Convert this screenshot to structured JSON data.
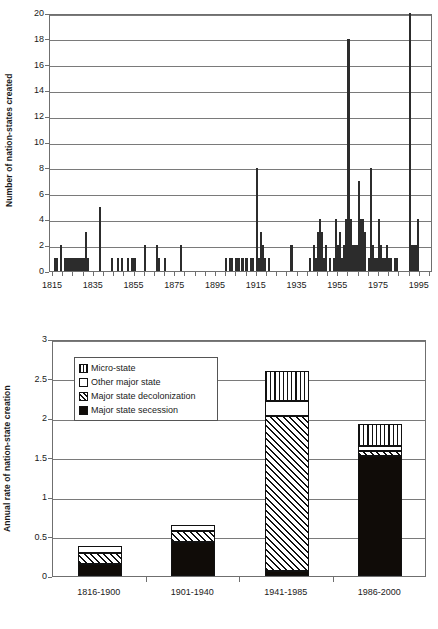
{
  "figure": {
    "charts": [
      {
        "id": "top",
        "ylabel": "Number of nation-states created",
        "yticks": [
          "0",
          "2",
          "4",
          "6",
          "8",
          "10",
          "12",
          "14",
          "16",
          "18",
          "20"
        ],
        "xticks": [
          "1815",
          "1835",
          "1855",
          "1875",
          "1895",
          "1915",
          "1935",
          "1955",
          "1975",
          "1995"
        ]
      },
      {
        "id": "bottom",
        "ylabel": "Annual rate of nation-state creation",
        "yticks": [
          "0",
          "0.5",
          "1",
          "1.5",
          "2",
          "2.5",
          "3"
        ],
        "xticks": [
          "1816-1900",
          "1901-1940",
          "1941-1985",
          "1986-2000"
        ],
        "legend": [
          {
            "key": "micro",
            "label": "Micro-state"
          },
          {
            "key": "other",
            "label": "Other major state"
          },
          {
            "key": "decol",
            "label": "Major state decolonization"
          },
          {
            "key": "secession",
            "label": "Major state secession"
          }
        ]
      }
    ]
  },
  "chart_data": [
    {
      "type": "bar",
      "title": "",
      "xlabel": "",
      "ylabel": "Number of nation-states created",
      "xlim": [
        1815,
        2000
      ],
      "ylim": [
        0,
        20
      ],
      "ytick_step": 2,
      "xtick_values": [
        1815,
        1835,
        1855,
        1875,
        1895,
        1915,
        1935,
        1955,
        1975,
        1995
      ],
      "grid": true,
      "legend_position": "none",
      "note": "Annual count of nation-states created, 1815-2000",
      "x": [
        1816,
        1817,
        1819,
        1821,
        1822,
        1823,
        1824,
        1825,
        1826,
        1827,
        1828,
        1829,
        1830,
        1831,
        1832,
        1838,
        1844,
        1847,
        1849,
        1852,
        1854,
        1855,
        1860,
        1866,
        1867,
        1870,
        1878,
        1900,
        1902,
        1903,
        1905,
        1906,
        1908,
        1910,
        1912,
        1913,
        1915,
        1916,
        1917,
        1918,
        1919,
        1921,
        1932,
        1941,
        1943,
        1944,
        1945,
        1946,
        1947,
        1948,
        1949,
        1951,
        1953,
        1954,
        1955,
        1956,
        1957,
        1958,
        1959,
        1960,
        1961,
        1962,
        1963,
        1964,
        1965,
        1966,
        1967,
        1968,
        1970,
        1971,
        1972,
        1973,
        1974,
        1975,
        1976,
        1977,
        1978,
        1979,
        1980,
        1981,
        1983,
        1984,
        1990,
        1991,
        1992,
        1993,
        1994
      ],
      "values": [
        1,
        1,
        2,
        1,
        1,
        1,
        1,
        1,
        1,
        1,
        1,
        1,
        1,
        3,
        1,
        5,
        1,
        1,
        1,
        1,
        1,
        1,
        2,
        2,
        1,
        1,
        2,
        1,
        1,
        1,
        1,
        1,
        1,
        1,
        1,
        1,
        8,
        1,
        3,
        2,
        1,
        1,
        2,
        1,
        2,
        1,
        3,
        4,
        3,
        1,
        2,
        1,
        1,
        4,
        2,
        3,
        1,
        2,
        4,
        18,
        4,
        2,
        2,
        2,
        7,
        4,
        4,
        3,
        1,
        8,
        2,
        1,
        1,
        4,
        2,
        1,
        1,
        2,
        1,
        1,
        1,
        1,
        20,
        2,
        2,
        2,
        4
      ]
    },
    {
      "type": "bar",
      "subtype": "stacked",
      "title": "",
      "xlabel": "",
      "ylabel": "Annual rate of nation-state creation",
      "ylim": [
        0,
        3
      ],
      "ytick_step": 0.5,
      "grid": true,
      "legend_position": "upper-left-inside",
      "categories": [
        "1816-1900",
        "1901-1940",
        "1941-1985",
        "1986-2000"
      ],
      "series": [
        {
          "name": "Major state secession",
          "key": "secession",
          "values": [
            0.15,
            0.43,
            0.06,
            1.52
          ]
        },
        {
          "name": "Major state decolonization",
          "key": "decol",
          "values": [
            0.14,
            0.14,
            1.96,
            0.06
          ]
        },
        {
          "name": "Other major state",
          "key": "other",
          "values": [
            0.09,
            0.07,
            0.19,
            0.07
          ]
        },
        {
          "name": "Micro-state",
          "key": "micro",
          "values": [
            0.0,
            0.0,
            0.39,
            0.28
          ]
        }
      ],
      "totals": [
        0.38,
        0.64,
        2.6,
        1.93
      ]
    }
  ]
}
